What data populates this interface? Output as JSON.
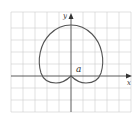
{
  "figure": {
    "type": "polar-curve-diagram",
    "curve": "cardioid",
    "axes": {
      "x_label": "x",
      "y_label": "y"
    },
    "annotation": "a",
    "colors": {
      "grid": "#c8c8c8",
      "axis": "#333333",
      "curve": "#555555",
      "background": "#ffffff"
    }
  }
}
